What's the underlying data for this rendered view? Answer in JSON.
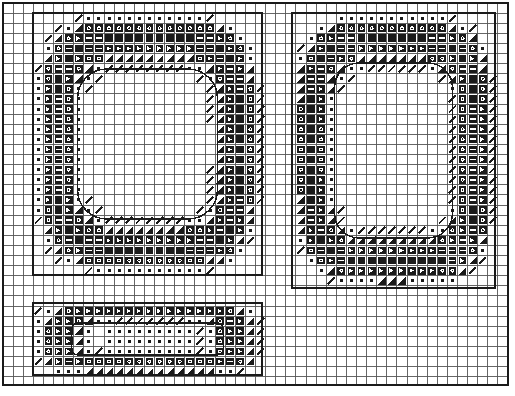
{
  "figure": {
    "title": "",
    "background_color": "#ffffff",
    "line_color": "#1a1a1a",
    "grid_color": "#555555",
    "width": 515,
    "height": 396
  },
  "frame": {
    "name": "outer-plot-frame",
    "x": 3,
    "y": 3,
    "width": 505,
    "height": 382,
    "stroke_width": 1.6
  },
  "grid": {
    "cell_size": 10.1,
    "origin_x": 3,
    "origin_y": 3,
    "cols": 50,
    "rows": 38,
    "stroke_width": 0.9,
    "visible": true
  },
  "regions": [
    {
      "name": "region-upper-left",
      "label": "Upper left rectangular region",
      "x": 33,
      "y": 13,
      "width": 229,
      "height": 262,
      "stroke_width": 1.8,
      "shape": "rounded-square-annulus",
      "inner_x": 78,
      "inner_y": 70,
      "inner_width": 140,
      "inner_height": 150
    },
    {
      "name": "region-upper-right",
      "label": "Upper right rectangular region",
      "x": 292,
      "y": 13,
      "width": 203,
      "height": 275,
      "stroke_width": 1.8,
      "shape": "rounded-square-annulus",
      "inner_x": 335,
      "inner_y": 65,
      "inner_width": 118,
      "inner_height": 175
    },
    {
      "name": "region-lower-left",
      "label": "Lower left rectangular region",
      "x": 33,
      "y": 303,
      "width": 229,
      "height": 72,
      "stroke_width": 1.8,
      "shape": "rounded-rect-annulus",
      "inner_x": 72,
      "inner_y": 323,
      "inner_width": 152,
      "inner_height": 32
    }
  ],
  "chart_data": {
    "type": "heatmap",
    "title": "",
    "subtitle": "",
    "xlabel": "",
    "ylabel": "",
    "legend": [],
    "grid": true,
    "xlim": [
      0,
      50
    ],
    "ylim": [
      0,
      38
    ],
    "xtick_labels": [],
    "ytick_labels": [],
    "symbol_levels": [
      {
        "level": 0,
        "glyph": "blank",
        "name": "level-0-blank",
        "description": "empty cell, no field"
      },
      {
        "level": 1,
        "glyph": "slash",
        "name": "level-1-slash",
        "description": "thin diagonal stroke, lowest magnitude"
      },
      {
        "level": 2,
        "glyph": "dot",
        "name": "level-2-dot",
        "description": "small centered square dot"
      },
      {
        "level": 3,
        "glyph": "wedge",
        "name": "level-3-wedge",
        "description": "solid triangular wedge"
      },
      {
        "level": 4,
        "glyph": "ring",
        "name": "level-4-ring",
        "description": "dark block with light ring centre"
      },
      {
        "level": 5,
        "glyph": "arrow",
        "name": "level-5-arrow",
        "description": "dark block with light arrow notch"
      },
      {
        "level": 6,
        "glyph": "bar",
        "name": "level-6-bar",
        "description": "dark block with light horizontal bar"
      },
      {
        "level": 7,
        "glyph": "solid",
        "name": "level-7-solid",
        "description": "fully dark cell, maximum magnitude"
      }
    ],
    "series": [
      {
        "name": "upper-left-region",
        "center": [
          147,
          144
        ],
        "ring_peak_level": 7,
        "interior_level": 0,
        "band_thickness_cells": 4.5
      },
      {
        "name": "upper-right-region",
        "center": [
          393,
          150
        ],
        "ring_peak_level": 7,
        "interior_level": 0,
        "band_thickness_cells": 4.0
      },
      {
        "name": "lower-left-region",
        "center": [
          147,
          339
        ],
        "ring_peak_level": 6,
        "interior_level": 2,
        "band_thickness_cells": 2.0
      }
    ]
  }
}
